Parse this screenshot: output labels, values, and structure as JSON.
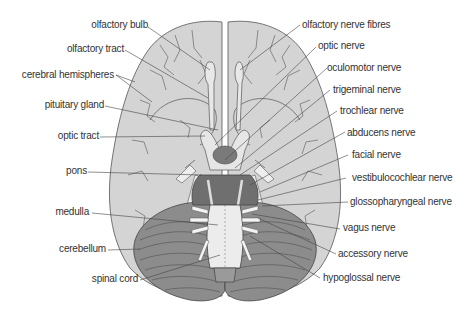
{
  "diagram": {
    "colors": {
      "cerebrum": "#d4d4d4",
      "cerebrum_stroke": "#555555",
      "cerebellum": "#8c8c8c",
      "cerebellum_light": "#bdbdbd",
      "pons": "#6f6f6f",
      "medulla": "#ececec",
      "pituitary": "#7a7a7a",
      "leader_line": "#444444",
      "label_text": "#333333"
    },
    "labels_left": [
      {
        "id": "olfactory-bulb",
        "text": "olfactory bulb"
      },
      {
        "id": "olfactory-tract",
        "text": "olfactory tract"
      },
      {
        "id": "cerebral-hemispheres",
        "text": "cerebral hemispheres"
      },
      {
        "id": "pituitary-gland",
        "text": "pituitary gland"
      },
      {
        "id": "optic-tract",
        "text": "optic tract"
      },
      {
        "id": "pons",
        "text": "pons"
      },
      {
        "id": "medulla",
        "text": "medulla"
      },
      {
        "id": "cerebellum",
        "text": "cerebellum"
      },
      {
        "id": "spinal-cord",
        "text": "spinal cord"
      }
    ],
    "labels_right": [
      {
        "id": "olfactory-nerve-fibres",
        "text": "olfactory nerve fibres"
      },
      {
        "id": "optic-nerve",
        "text": "optic nerve"
      },
      {
        "id": "oculomotor-nerve",
        "text": "oculomotor nerve"
      },
      {
        "id": "trigeminal-nerve",
        "text": "trigeminal nerve"
      },
      {
        "id": "trochlear-nerve",
        "text": "trochlear nerve"
      },
      {
        "id": "abducens-nerve",
        "text": "abducens nerve"
      },
      {
        "id": "facial-nerve",
        "text": "facial nerve"
      },
      {
        "id": "vestibulocochlear-nerve",
        "text": "vestibulocochlear nerve"
      },
      {
        "id": "glossopharyngeal-nerve",
        "text": "glossopharyngeal nerve"
      },
      {
        "id": "vagus-nerve",
        "text": "vagus nerve"
      },
      {
        "id": "accessory-nerve",
        "text": "accessory nerve"
      },
      {
        "id": "hypoglossal-nerve",
        "text": "hypoglossal nerve"
      }
    ]
  }
}
